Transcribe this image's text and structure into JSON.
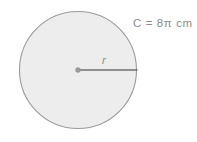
{
  "figure": {
    "type": "circle-diagram",
    "background_color": "#ffffff",
    "circle": {
      "center_x": 78,
      "center_y": 70,
      "radius": 60,
      "fill_color": "#ededed",
      "stroke_color": "#999999",
      "stroke_width": 1
    },
    "center_point": {
      "color": "#9a9a9a",
      "radius": 2.6
    },
    "radius_segment": {
      "from_x": 78,
      "from_y": 70,
      "to_x": 138,
      "to_y": 70,
      "color": "#6e6e6e",
      "stroke_width": 1.4
    },
    "labels": {
      "circumference": "C = 8π cm",
      "radius": "r",
      "text_color": "#8c8c8c"
    }
  }
}
